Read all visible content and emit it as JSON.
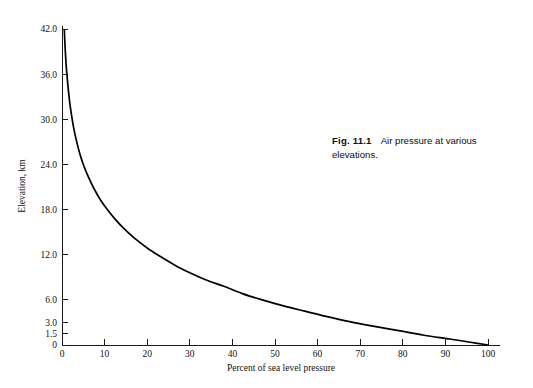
{
  "figure": {
    "caption_label": "Fig. 11.1",
    "caption_text": "Air pressure at various elevations."
  },
  "chart_data": {
    "type": "line",
    "title": "",
    "xlabel": "Percent of sea level pressure",
    "ylabel": "Elevation, km",
    "xlim": [
      0,
      100
    ],
    "ylim": [
      0,
      42
    ],
    "grid": false,
    "legend": null,
    "xticks": [
      0,
      10,
      20,
      30,
      40,
      50,
      60,
      70,
      80,
      90,
      100
    ],
    "xtick_labels": [
      "0",
      "10",
      "20",
      "30",
      "40",
      "50",
      "60",
      "70",
      "80",
      "90",
      "100"
    ],
    "yticks": [
      0,
      1.5,
      3.0,
      6.0,
      12.0,
      18.0,
      24.0,
      30.0,
      36.0,
      42.0
    ],
    "ytick_labels": [
      "0",
      "1.5",
      "3.0",
      "6.0",
      "12.0",
      "18.0",
      "24.0",
      "30.0",
      "36.0",
      "42.0"
    ],
    "line_color": "#000000",
    "series": [
      {
        "name": "Air pressure vs elevation",
        "x": [
          0.55,
          0.7,
          0.9,
          1.1,
          1.4,
          1.8,
          2.2,
          2.8,
          3.5,
          4.3,
          5.2,
          6.3,
          7.5,
          9.0,
          10.5,
          12.5,
          14.5,
          17.0,
          20.0,
          23.0,
          26.5,
          30.0,
          34.0,
          38.0,
          42.5,
          47.0,
          52.0,
          57.0,
          62.0,
          67.5,
          73.0,
          79.0,
          85.0,
          91.0,
          95.5,
          100.0
        ],
        "y": [
          41.8,
          39.9,
          37.9,
          36.3,
          34.4,
          32.3,
          30.7,
          28.7,
          26.9,
          25.2,
          23.7,
          22.2,
          20.8,
          19.3,
          18.1,
          16.7,
          15.5,
          14.2,
          12.9,
          11.8,
          10.6,
          9.6,
          8.6,
          7.8,
          6.8,
          6.0,
          5.2,
          4.5,
          3.8,
          3.1,
          2.5,
          1.9,
          1.3,
          0.8,
          0.4,
          0.0
        ]
      }
    ]
  }
}
